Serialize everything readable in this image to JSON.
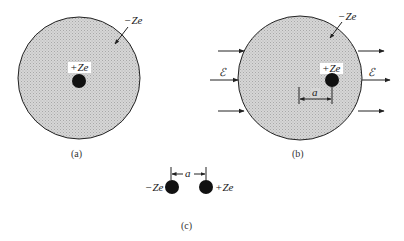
{
  "figure": {
    "panel_a": {
      "caption": "(a)",
      "electron_cloud_label": "−Ze",
      "nucleus_label": "+Ze"
    },
    "panel_b": {
      "caption": "(b)",
      "electron_cloud_label": "−Ze",
      "nucleus_label": "+Ze",
      "field_label_left": "ℰ",
      "field_label_right": "ℰ",
      "displacement_label": "a"
    },
    "panel_c": {
      "caption": "(c)",
      "negative_label": "−Ze",
      "positive_label": "+Ze",
      "separation_label": "a"
    },
    "colors": {
      "cloud_fill": "#cfcfcf",
      "outline": "#222222",
      "charge": "#111111"
    }
  }
}
